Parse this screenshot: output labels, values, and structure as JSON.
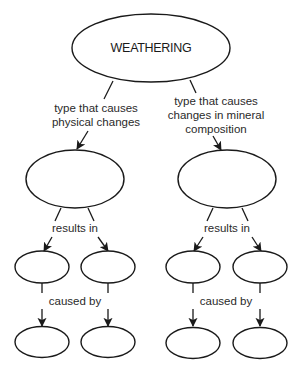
{
  "diagram": {
    "root": {
      "label": "WEATHERING"
    },
    "branches": [
      {
        "edge_label_lines": [
          "type that causes",
          "physical changes"
        ],
        "node": {
          "label": ""
        },
        "results_label": "results in",
        "results": [
          {
            "label": "",
            "caused_by": {
              "label": ""
            }
          },
          {
            "label": "",
            "caused_by": {
              "label": ""
            }
          }
        ],
        "caused_by_label": "caused by"
      },
      {
        "edge_label_lines": [
          "type that causes",
          "changes in mineral",
          "composition"
        ],
        "node": {
          "label": ""
        },
        "results_label": "results in",
        "results": [
          {
            "label": "",
            "caused_by": {
              "label": ""
            }
          },
          {
            "label": "",
            "caused_by": {
              "label": ""
            }
          }
        ],
        "caused_by_label": "caused by"
      }
    ]
  },
  "colors": {
    "stroke": "#1a1a1a",
    "background": "#ffffff",
    "text": "#1a1a1a"
  }
}
